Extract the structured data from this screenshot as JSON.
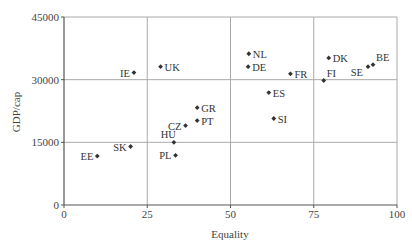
{
  "chart_data": {
    "type": "scatter",
    "title": "",
    "xlabel": "Equality",
    "ylabel": "GDP/cap",
    "xlim": [
      0,
      100
    ],
    "ylim": [
      0,
      45000
    ],
    "xticks": [
      0,
      25,
      50,
      75,
      100
    ],
    "yticks": [
      0,
      15000,
      30000,
      45000
    ],
    "grid": true,
    "legend": null,
    "marker_color": "#333333",
    "grid_color": "#aaaaaa",
    "points": [
      {
        "label": "EE",
        "x": 10,
        "y": 11700,
        "label_pos": "left"
      },
      {
        "label": "SK",
        "x": 20,
        "y": 14000,
        "label_pos": "left"
      },
      {
        "label": "IE",
        "x": 21,
        "y": 31700,
        "label_pos": "left"
      },
      {
        "label": "UK",
        "x": 29,
        "y": 33100,
        "label_pos": "right"
      },
      {
        "label": "HU",
        "x": 33,
        "y": 15000,
        "label_pos": "above-left"
      },
      {
        "label": "PL",
        "x": 33.5,
        "y": 11900,
        "label_pos": "left"
      },
      {
        "label": "CZ",
        "x": 36.5,
        "y": 19000,
        "label_pos": "left"
      },
      {
        "label": "GR",
        "x": 40,
        "y": 23300,
        "label_pos": "right"
      },
      {
        "label": "PT",
        "x": 40,
        "y": 20200,
        "label_pos": "right"
      },
      {
        "label": "NL",
        "x": 55.5,
        "y": 36200,
        "label_pos": "right"
      },
      {
        "label": "DE",
        "x": 55.3,
        "y": 33100,
        "label_pos": "right"
      },
      {
        "label": "ES",
        "x": 61.5,
        "y": 26900,
        "label_pos": "right"
      },
      {
        "label": "SI",
        "x": 63,
        "y": 20700,
        "label_pos": "right"
      },
      {
        "label": "FR",
        "x": 68,
        "y": 31400,
        "label_pos": "right"
      },
      {
        "label": "FI",
        "x": 78,
        "y": 29800,
        "label_pos": "above-right"
      },
      {
        "label": "DK",
        "x": 79.5,
        "y": 35200,
        "label_pos": "right"
      },
      {
        "label": "SE",
        "x": 91.3,
        "y": 33100,
        "label_pos": "below-left"
      },
      {
        "label": "BE",
        "x": 92.8,
        "y": 33600,
        "label_pos": "above-right"
      }
    ]
  }
}
